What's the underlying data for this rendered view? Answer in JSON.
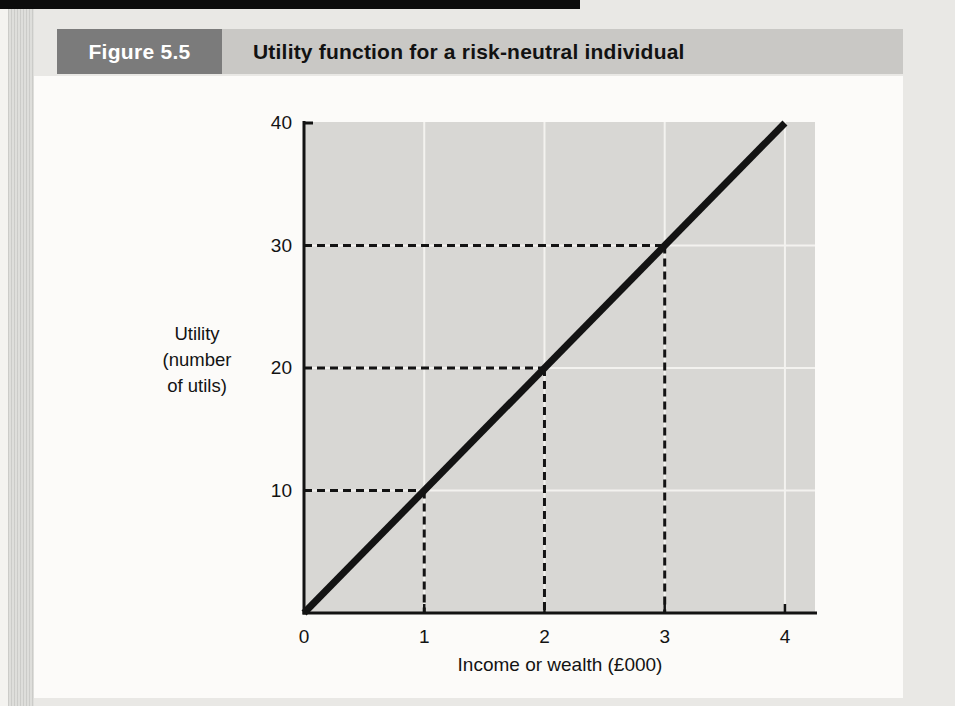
{
  "page": {
    "figure_label": "Figure 5.5",
    "figure_title": "Utility function for a risk-neutral individual"
  },
  "colors": {
    "page_background": "#e9e8e5",
    "top_bar": "#0c0c0c",
    "header_box": "#7b7b7b",
    "header_bar": "#c9c8c5",
    "content_background": "#fcfbf9",
    "plot_background": "#d8d7d4",
    "gridline": "#f3f2ef",
    "ink": "#131313"
  },
  "chart_data": {
    "type": "line",
    "title": "Utility function for a risk-neutral individual",
    "xlabel": "Income or wealth (£000)",
    "ylabel": "Utility (number of utils)",
    "ylabel_lines": [
      "Utility",
      "(number",
      "of utils)"
    ],
    "xlim": [
      0,
      4.25
    ],
    "ylim": [
      0,
      40
    ],
    "x_ticks": [
      0,
      1,
      2,
      3,
      4
    ],
    "y_ticks": [
      10,
      20,
      30,
      40
    ],
    "grid": true,
    "legend": false,
    "series": [
      {
        "name": "utility-line",
        "x": [
          0,
          4
        ],
        "y": [
          0,
          40
        ]
      }
    ],
    "guide_points": [
      {
        "x": 1,
        "utility": 10
      },
      {
        "x": 2,
        "utility": 20
      },
      {
        "x": 3,
        "utility": 30
      }
    ]
  }
}
